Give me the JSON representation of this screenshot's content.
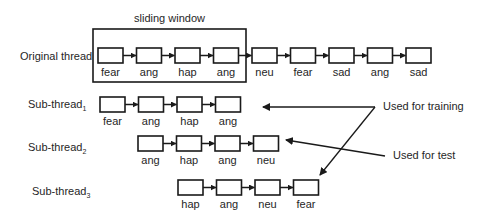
{
  "window": {
    "title": "sliding window",
    "rect": {
      "x": 93,
      "y": 29,
      "w": 153,
      "h": 53
    }
  },
  "layout": {
    "box_w": 25,
    "box_h": 15,
    "step": 38.5,
    "label_offset": 13
  },
  "rows": [
    {
      "id": "original",
      "label": "Original thread",
      "label_x": 20,
      "label_y": 60,
      "start_x": 98,
      "y": 48,
      "items": [
        "fear",
        "ang",
        "hap",
        "ang",
        "neu",
        "fear",
        "sad",
        "ang",
        "sad"
      ]
    },
    {
      "id": "sub1",
      "label": "Sub-thread",
      "subscript": "1",
      "label_x": 28,
      "label_y": 108,
      "start_x": 100,
      "y": 97,
      "items": [
        "fear",
        "ang",
        "hap",
        "ang"
      ]
    },
    {
      "id": "sub2",
      "label": "Sub-thread",
      "subscript": "2",
      "label_x": 28,
      "label_y": 151,
      "start_x": 138,
      "y": 136,
      "items": [
        "ang",
        "hap",
        "ang",
        "neu"
      ]
    },
    {
      "id": "sub3",
      "label": "Sub-thread",
      "subscript": "3",
      "label_x": 32,
      "label_y": 195,
      "start_x": 178,
      "y": 180,
      "items": [
        "hap",
        "ang",
        "neu",
        "fear"
      ]
    }
  ],
  "annotations": {
    "training": {
      "text": "Used for training",
      "text_x": 383,
      "text_y": 110,
      "origin": {
        "x": 375,
        "y": 107
      },
      "targets": [
        {
          "x": 263,
          "y": 107
        },
        {
          "x": 320,
          "y": 175
        }
      ]
    },
    "test": {
      "text": "Used for test",
      "text_x": 393,
      "text_y": 159,
      "origin": {
        "x": 385,
        "y": 156
      },
      "targets": [
        {
          "x": 286,
          "y": 140
        }
      ]
    }
  }
}
